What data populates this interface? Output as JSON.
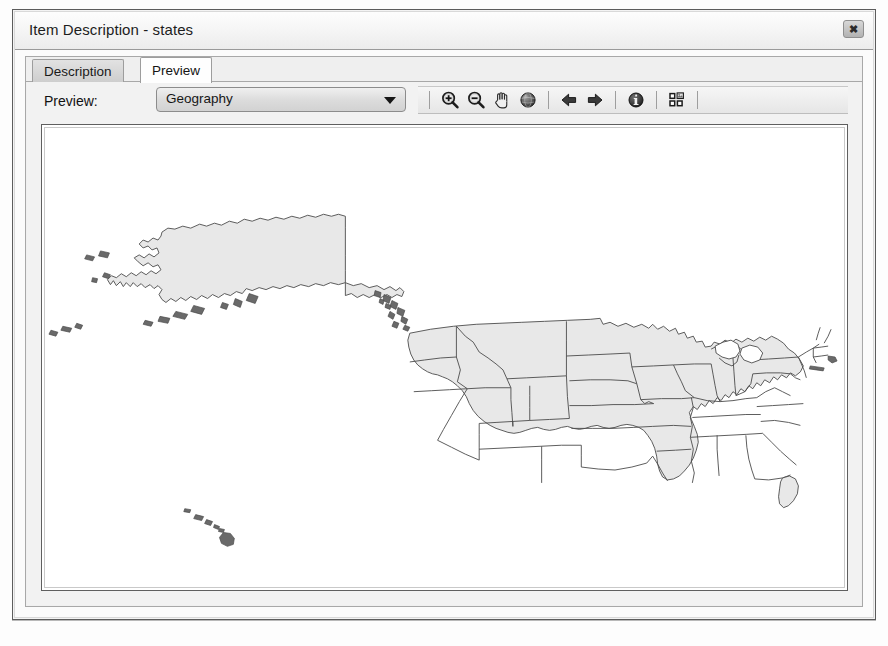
{
  "window": {
    "title": "Item Description - states",
    "close_label": "✖",
    "close_icon": "close-icon"
  },
  "tabs": [
    {
      "label": "Description",
      "active": false
    },
    {
      "label": "Preview",
      "active": true
    }
  ],
  "preview": {
    "label": "Preview:",
    "combo": {
      "value": "Geography",
      "placeholder": "Geography",
      "options": [
        "Geography",
        "Table"
      ],
      "arrow_icon": "chevron-down-icon"
    }
  },
  "toolbar": {
    "buttons": [
      {
        "name": "zoom-in-icon",
        "title": "Zoom In"
      },
      {
        "name": "zoom-out-icon",
        "title": "Zoom Out"
      },
      {
        "name": "pan-hand-icon",
        "title": "Pan"
      },
      {
        "name": "full-extent-globe-icon",
        "title": "Full Extent"
      },
      {
        "name": "back-arrow-icon",
        "title": "Go Back To Previous Extent"
      },
      {
        "name": "forward-arrow-icon",
        "title": "Go To Next Extent"
      },
      {
        "name": "identify-info-icon",
        "title": "Identify"
      },
      {
        "name": "create-thumbnail-icon",
        "title": "Create Thumbnail"
      }
    ]
  },
  "map": {
    "features": [
      "Alaska",
      "Aleutian Islands",
      "Contiguous United States",
      "Hawaii"
    ],
    "fill_color": "#e8e8e8",
    "outline_color": "#4a4a4a"
  }
}
